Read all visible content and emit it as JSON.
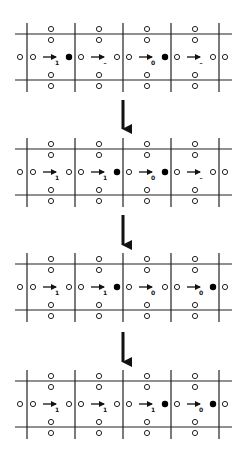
{
  "colors": {
    "line": "#222222",
    "filled": "#000000",
    "open_stroke": "#222222",
    "background": "#ffffff"
  },
  "grid": {
    "vertical_lines_x": [
      27,
      75,
      123,
      171,
      219
    ],
    "cell_centers_x": [
      51,
      99,
      147,
      195
    ],
    "h_line_x": [
      15,
      232
    ]
  },
  "panels": [
    {
      "top": 23,
      "cells": [
        {
          "label": "1",
          "site": "filled"
        },
        {
          "label": "–",
          "site": "open"
        },
        {
          "label": "0",
          "site": "filled"
        },
        {
          "label": "–",
          "site": "open"
        }
      ]
    },
    {
      "top": 138,
      "cells": [
        {
          "label": "1",
          "site": "open"
        },
        {
          "label": "1",
          "site": "filled"
        },
        {
          "label": "0",
          "site": "filled"
        },
        {
          "label": "–",
          "site": "open"
        }
      ]
    },
    {
      "top": 253,
      "cells": [
        {
          "label": "1",
          "site": "open"
        },
        {
          "label": "1",
          "site": "filled"
        },
        {
          "label": "0",
          "site": "open"
        },
        {
          "label": "0",
          "site": "filled"
        }
      ]
    },
    {
      "top": 370,
      "cells": [
        {
          "label": "1",
          "site": "open"
        },
        {
          "label": "1",
          "site": "open"
        },
        {
          "label": "1",
          "site": "filled"
        },
        {
          "label": "0",
          "site": "filled"
        }
      ]
    }
  ],
  "transition_arrows": [
    {
      "x": 123,
      "y1": 100,
      "y2": 130
    },
    {
      "x": 123,
      "y1": 215,
      "y2": 246
    },
    {
      "x": 123,
      "y1": 332,
      "y2": 363
    }
  ]
}
